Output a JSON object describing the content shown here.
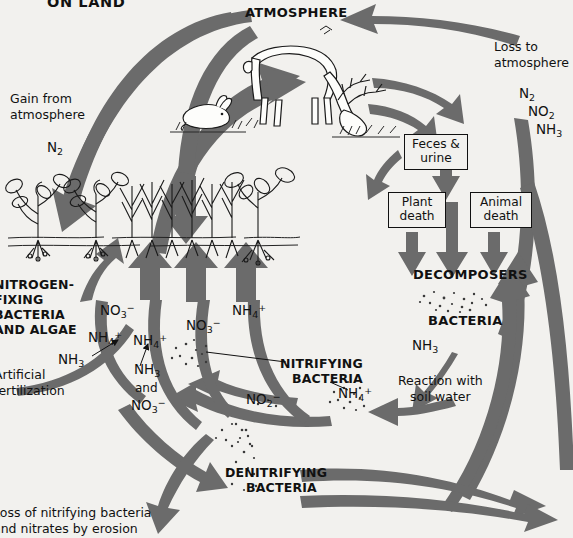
{
  "diagram": {
    "title": "ON LAND",
    "background_color": "#f2f1ee",
    "arrow_color": "#6b6b6b",
    "text_color": "#111111"
  },
  "headings": {
    "atmosphere": "ATMOSPHERE",
    "decomposers": "DECOMPOSERS",
    "bacteria": "BACTERIA",
    "nitrifying_bacteria_line1": "NITRIFYING",
    "nitrifying_bacteria_line2": "BACTERIA",
    "denitrifying_bacteria_line1": "DENITRIFYING",
    "denitrifying_bacteria_line2": "BACTERIA",
    "nitrogen_fixing_line1": "NITROGEN-",
    "nitrogen_fixing_line2": "FIXING",
    "nitrogen_fixing_line3": "BACTERIA",
    "nitrogen_fixing_line4": "AND ALGAE"
  },
  "labels": {
    "gain_from_atmosphere_line1": "Gain from",
    "gain_from_atmosphere_line2": "atmosphere",
    "loss_to_atmosphere_line1": "Loss to",
    "loss_to_atmosphere_line2": "atmosphere",
    "reaction_with_soil_water_line1": "Reaction with",
    "reaction_with_soil_water_line2": "soil water",
    "artificial_fertilization_line1": "Artificial",
    "artificial_fertilization_line2": "fertilization",
    "erosion_loss_line1": "Loss of nitrifying bacteria",
    "erosion_loss_line2": "and nitrates by erosion"
  },
  "boxes": {
    "feces_urine_line1": "Feces &",
    "feces_urine_line2": "urine",
    "plant_death_line1": "Plant",
    "plant_death_line2": "death",
    "animal_death_line1": "Animal",
    "animal_death_line2": "death"
  },
  "chemicals": {
    "n2_gain": "N2",
    "n2_loss": "N2",
    "no2_loss": "NO2",
    "nh3_loss": "NH3",
    "nh3_decomposer": "NH3",
    "no3_left": "NO3-",
    "nh4_left": "NH4+",
    "nh3_left": "NH3",
    "nh4_mid": "NH4+",
    "nh3_and_mid": "NH3",
    "and_mid": "and",
    "no3_mid": "NO3-",
    "no3_right": "NO3-",
    "nh4_right": "NH4+",
    "no2_nitrify": "NO2-",
    "nh4_nitrify": "NH4+"
  },
  "illustrations": {
    "deer": "grazing-deer",
    "rabbit": "resting-rabbit",
    "plants": "plants-with-roots",
    "grass": "grass-clump",
    "soil_particles": "bacteria-dots"
  }
}
